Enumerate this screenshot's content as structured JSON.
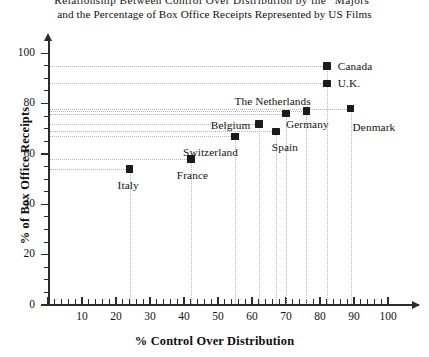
{
  "chart_data": {
    "type": "scatter",
    "title": "Relationship Between Control Over Distribution by the “Majors” and the Percentage of Box Office Receipts Represented by US Films",
    "title_lines": [
      "Relationship Between Control Over Distribution by the “Majors”",
      "and the Percentage of Box Office Receipts Represented by US Films"
    ],
    "xlabel": "% Control Over Distribution",
    "ylabel": "% of Box Office Receipts",
    "xlim": [
      0,
      100
    ],
    "ylim": [
      0,
      100
    ],
    "x_ticks": [
      0,
      10,
      20,
      30,
      40,
      50,
      60,
      70,
      80,
      90,
      100
    ],
    "x_tick_labels": [
      "",
      "10",
      "20",
      "30",
      "40",
      "50",
      "60",
      "70",
      "80",
      "90",
      "100"
    ],
    "y_ticks": [
      0,
      20,
      40,
      60,
      80,
      100
    ],
    "y_tick_labels": [
      "0",
      "20",
      "40",
      "60",
      "80",
      "100"
    ],
    "x_minor_step": 2,
    "y_minor_step": 5,
    "grid": false,
    "guide_lines": "dotted leaders from each point to both axes",
    "legend": "none (points labelled directly)",
    "marker_color": "#1b1b1b",
    "marker_shape": "square",
    "points": [
      {
        "label": "Italy",
        "x": 24,
        "y": 54,
        "label_pos": "below"
      },
      {
        "label": "France",
        "x": 42,
        "y": 58,
        "label_pos": "below"
      },
      {
        "label": "Switzerland",
        "x": 55,
        "y": 67,
        "label_pos": "below-left"
      },
      {
        "label": "Belgium",
        "x": 62,
        "y": 72,
        "label_pos": "left"
      },
      {
        "label": "Spain",
        "x": 67,
        "y": 69,
        "label_pos": "below"
      },
      {
        "label": "Germany",
        "x": 70,
        "y": 76,
        "label_pos": "below-right"
      },
      {
        "label": "The Netherlands",
        "x": 76,
        "y": 77,
        "label_pos": "above-left"
      },
      {
        "label": "Denmark",
        "x": 89,
        "y": 78,
        "label_pos": "below-right"
      },
      {
        "label": "U.K.",
        "x": 82,
        "y": 88,
        "label_pos": "right"
      },
      {
        "label": "Canada",
        "x": 82,
        "y": 95,
        "label_pos": "right"
      }
    ]
  }
}
